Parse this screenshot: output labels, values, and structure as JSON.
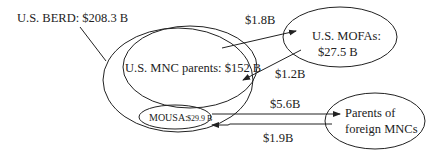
{
  "diagram": {
    "nodes": {
      "berd": {
        "label": "U.S. BERD: $208.3 B"
      },
      "mnc_parents": {
        "label": "U.S. MNC parents: $152 B"
      },
      "mofas": {
        "label_line1": "U.S. MOFAs:",
        "label_line2": "$27.5 B"
      },
      "mousa": {
        "label_name": "MOUSA:",
        "label_value": "$29.9 B"
      },
      "foreign_parents": {
        "label_line1": "Parents of",
        "label_line2": "foreign MNCs"
      }
    },
    "flows": [
      {
        "from": "U.S. MNC parents",
        "to": "U.S. MOFAs",
        "label": "$1.8B"
      },
      {
        "from": "U.S. MOFAs",
        "to": "U.S. MNC parents",
        "label": "$1.2B"
      },
      {
        "from": "MOUSA",
        "to": "Parents of foreign MNCs",
        "label": "$5.6B"
      },
      {
        "from": "Parents of foreign MNCs",
        "to": "MOUSA",
        "label": "$1.9B"
      }
    ],
    "colors": {
      "ink": "#222222",
      "background": "#ffffff"
    }
  }
}
